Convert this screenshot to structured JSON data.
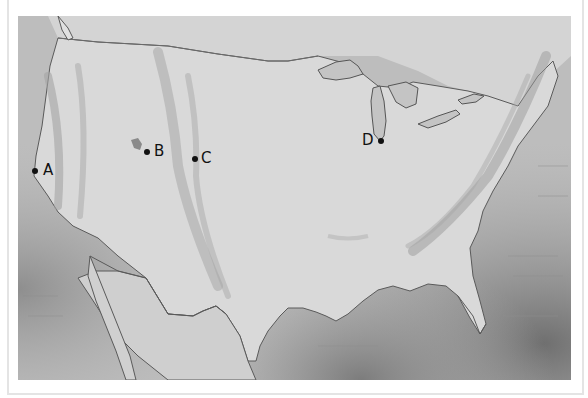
{
  "map": {
    "region": "Contiguous United States",
    "style": "greyscale shaded relief",
    "markers": [
      {
        "id": "A",
        "label": "A",
        "location": "California coast"
      },
      {
        "id": "B",
        "label": "B",
        "location": "Great Salt Lake area"
      },
      {
        "id": "C",
        "label": "C",
        "location": "Rocky Mountains front range"
      },
      {
        "id": "D",
        "label": "D",
        "location": "Southern tip of Lake Michigan"
      }
    ]
  },
  "colors": {
    "land": "#d6d6d6",
    "ocean_dark": "#8a8a8a",
    "coastline": "#555555",
    "marker": "#111111",
    "frame": "#e4e4e4"
  }
}
